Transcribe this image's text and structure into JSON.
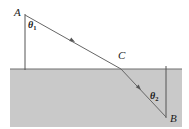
{
  "figure": {
    "type": "optics-ray-diagram",
    "width": 189,
    "height": 129,
    "background_color": "#ffffff",
    "stroke_color": "#555555",
    "label_color": "#1a1a1a",
    "medium": {
      "name": "lower-medium-shaded-region",
      "fill_color": "#c9c9c9",
      "x": 10,
      "y": 69,
      "width": 172,
      "height": 58
    },
    "interface": {
      "name": "interface-line",
      "x1": 10,
      "y1": 69,
      "x2": 182,
      "y2": 69
    },
    "normals": [
      {
        "name": "normal-at-A",
        "x1": 25,
        "y1": 14,
        "x2": 25,
        "y2": 70
      },
      {
        "name": "normal-at-B",
        "x1": 166,
        "y1": 66,
        "x2": 166,
        "y2": 118
      }
    ],
    "rays": [
      {
        "name": "incident-ray-A-to-C",
        "from": "A",
        "to": "C",
        "x1": 25,
        "y1": 15,
        "x2": 121,
        "y2": 69,
        "arrow_at": {
          "x": 73,
          "y": 41
        }
      },
      {
        "name": "refracted-ray-C-to-B",
        "from": "C",
        "to": "B",
        "x1": 121,
        "y1": 69,
        "x2": 166,
        "y2": 117,
        "arrow_at": {
          "x": 139,
          "y": 88
        }
      }
    ],
    "points": [
      {
        "id": "A",
        "label": "A",
        "x": 25,
        "y": 15
      },
      {
        "id": "C",
        "label": "C",
        "x": 121,
        "y": 69
      },
      {
        "id": "B",
        "label": "B",
        "x": 166,
        "y": 117
      }
    ],
    "angles": [
      {
        "id": "theta1",
        "symbol": "θ",
        "subscript": "1",
        "description": "angle-of-incidence-at-A"
      },
      {
        "id": "theta2",
        "symbol": "θ",
        "subscript": "2",
        "description": "angle-of-refraction-at-B"
      }
    ]
  }
}
